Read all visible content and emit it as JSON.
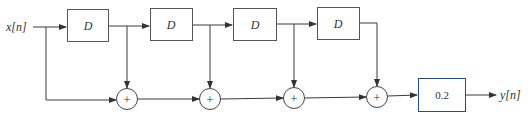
{
  "diagram": {
    "type": "block-diagram",
    "input_label": "x[n]",
    "output_label": "y[n]",
    "delays": [
      {
        "id": "d1",
        "label": "D"
      },
      {
        "id": "d2",
        "label": "D"
      },
      {
        "id": "d3",
        "label": "D"
      },
      {
        "id": "d4",
        "label": "D"
      }
    ],
    "adders": [
      {
        "id": "s1",
        "symbol": "+"
      },
      {
        "id": "s2",
        "symbol": "+"
      },
      {
        "id": "s3",
        "symbol": "+"
      },
      {
        "id": "s4",
        "symbol": "+"
      }
    ],
    "gain": {
      "id": "g",
      "label": "0.2"
    },
    "connections": [
      [
        "x[n]",
        "d1"
      ],
      [
        "x[n]",
        "s1"
      ],
      [
        "d1",
        "d2"
      ],
      [
        "d1",
        "s1"
      ],
      [
        "d2",
        "d3"
      ],
      [
        "d2",
        "s2"
      ],
      [
        "d3",
        "d4"
      ],
      [
        "d3",
        "s3"
      ],
      [
        "d4",
        "s4"
      ],
      [
        "s1",
        "s2"
      ],
      [
        "s2",
        "s3"
      ],
      [
        "s3",
        "s4"
      ],
      [
        "s4",
        "g"
      ],
      [
        "g",
        "y[n]"
      ]
    ]
  }
}
